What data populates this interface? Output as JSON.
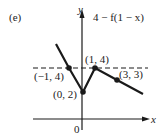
{
  "figure": {
    "panel_label": "(e)",
    "function_label": "4 − f(1 − x)",
    "axis_x_label": "x",
    "axis_y_label": "y",
    "origin_label": "0",
    "points": [
      {
        "label": "(−1, 4)",
        "x": -1,
        "y": 4
      },
      {
        "label": "(0, 2)",
        "x": 0,
        "y": 2
      },
      {
        "label": "(1, 4)",
        "x": 1,
        "y": 4
      },
      {
        "label": "(3, 3)",
        "x": 3,
        "y": 3
      }
    ],
    "dashed_line_y": 4,
    "colors": {
      "ink": "#1a1a1a",
      "background": "#ffffff"
    }
  }
}
